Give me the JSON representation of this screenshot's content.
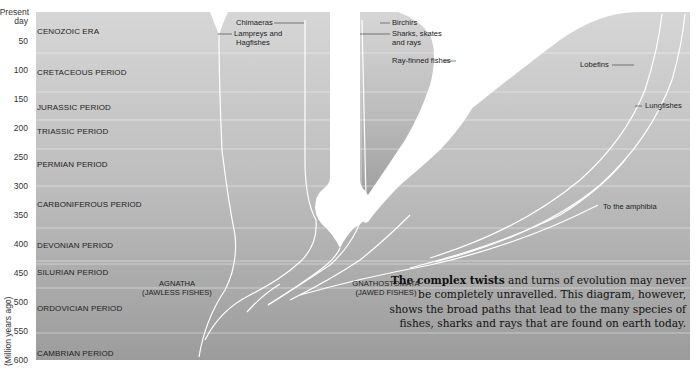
{
  "axis": {
    "title": "(Million years ago)",
    "top_label_line1": "Present",
    "top_label_line2": "day",
    "ticks": [
      "50",
      "100",
      "150",
      "200",
      "250",
      "300",
      "350",
      "400",
      "450",
      "500",
      "550",
      "600"
    ]
  },
  "periods": [
    {
      "name": "CENOZOIC ERA"
    },
    {
      "name": "CRETACEOUS PERIOD"
    },
    {
      "name": "JURASSIC PERIOD"
    },
    {
      "name": "TRIASSIC PERIOD"
    },
    {
      "name": "PERMIAN PERIOD"
    },
    {
      "name": "CARBONIFEROUS PERIOD"
    },
    {
      "name": "DEVONIAN PERIOD"
    },
    {
      "name": "SILURIAN PERIOD"
    },
    {
      "name": "ORDOVICIAN PERIOD"
    },
    {
      "name": "CAMBRIAN PERIOD"
    }
  ],
  "taxa": {
    "chimaeras": "Chimaeras",
    "lampreys_line1": "Lampreys and",
    "lampreys_line2": "Hagfishes",
    "birchirs": "Birchirs",
    "sharks_line1": "Sharks, skates",
    "sharks_line2": "and rays",
    "ray_finned": "Ray-finned fishes",
    "lobefins": "Lobefins",
    "lungfishes": "Lungfishes",
    "amphibia": "To the amphibia"
  },
  "groups": {
    "agnatha_line1": "AGNATHA",
    "agnatha_line2": "(JAWLESS FISHES)",
    "gnatho_line1": "GNATHOSTOMATA",
    "gnatho_line2": "(JAWED FISHES)"
  },
  "caption": {
    "bold": "The complex twists",
    "rest": " and turns of evolution may never be completely unravelled. This diagram, however, shows the broad paths that lead to the many species of fishes, sharks and rays that are found on earth today."
  },
  "colors": {
    "panel_top": "#d4d4d4",
    "panel_bottom": "#9a9a9a",
    "branch": "#ffffff",
    "text": "#222222"
  }
}
